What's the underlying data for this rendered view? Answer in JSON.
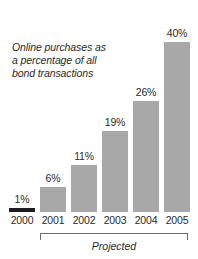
{
  "chart_data": {
    "type": "bar",
    "title": "",
    "subtitle": "",
    "caption_lines": [
      "Online purchases as",
      "a percentage of all",
      "bond transactions"
    ],
    "categories": [
      "2000",
      "2001",
      "2002",
      "2003",
      "2004",
      "2005"
    ],
    "values": [
      1,
      6,
      11,
      19,
      26,
      40
    ],
    "value_labels": [
      "1%",
      "6%",
      "11%",
      "19%",
      "26%",
      "40%"
    ],
    "xlabel": "",
    "ylabel": "",
    "ylim": [
      0,
      44
    ],
    "grid": false,
    "legend": null,
    "annotations": [
      {
        "text": "Projected",
        "covers_categories": [
          "2001",
          "2002",
          "2003",
          "2004",
          "2005"
        ]
      }
    ],
    "series_colors": [
      "#1c1c1c",
      "#a8a8a8",
      "#a8a8a8",
      "#a8a8a8",
      "#a8a8a8",
      "#a8a8a8"
    ]
  },
  "colors": {
    "bar_gray": "#a8a8a8",
    "bar_dark": "#1c1c1c",
    "text": "#2b2b2b",
    "bracket": "#6d6d6d",
    "background": "#ffffff"
  }
}
